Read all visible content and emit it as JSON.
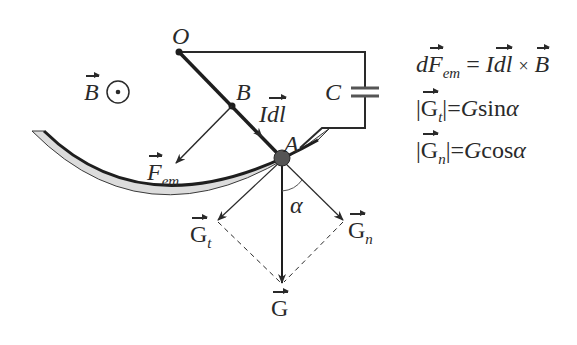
{
  "diagram": {
    "type": "physics-force-diagram",
    "labels": {
      "O": "O",
      "B_point": "B",
      "A": "A",
      "C": "C",
      "field": "B",
      "field_symbol": "⊙",
      "Idl": "Idl",
      "Idl_I": "I",
      "Idl_dl": "dl",
      "F_em": "F",
      "F_em_sub": "em",
      "G": "G",
      "Gt": "G",
      "Gt_sub": "t",
      "Gn": "G",
      "Gn_sub": "n",
      "alpha": "α"
    },
    "equations": [
      {
        "lhs_d": "d",
        "lhs_F": "F",
        "lhs_sub": "em",
        "eq": "=",
        "rhs_I": "I",
        "rhs_dl": "dl",
        "times": "×",
        "rhs_B": "B"
      },
      {
        "bar_open": "|",
        "G": "G",
        "sub": "t",
        "bar_close": "|",
        "eq": "=",
        "rhs_G": "G",
        "fn": "sin",
        "angle": "α"
      },
      {
        "bar_open": "|",
        "G": "G",
        "sub": "n",
        "bar_close": "|",
        "eq": "=",
        "rhs_G": "G",
        "fn": "cos",
        "angle": "α"
      }
    ],
    "colors": {
      "ink": "#2a2a2a",
      "arc_fill": "#dcdcdc",
      "ball": "#555555",
      "background": "#ffffff"
    }
  }
}
